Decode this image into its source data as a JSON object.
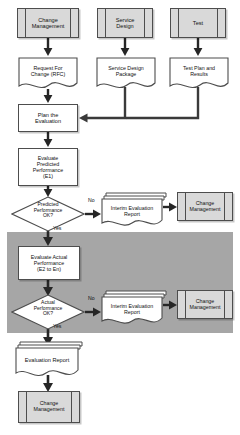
{
  "diagram": {
    "type": "flowchart",
    "colors": {
      "process_fill": "#ffffff",
      "predefined_process_fill": "#d9d9d9",
      "document_fill": "#ffffff",
      "band_fill": "#a6a6a6",
      "stroke": "#4d4d4d",
      "arrow": "#262626",
      "text": "#111111"
    },
    "band": {
      "name": "iterative-actual-evaluation-band",
      "note": "shaded region enclosing the repeated actual-performance evaluation loop"
    },
    "inputs": [
      {
        "id": "change-management-top",
        "shape": "predefined-process",
        "label": "Change\nManagement",
        "label_lines": [
          "Change",
          "Management"
        ],
        "produces": "request-for-change"
      },
      {
        "id": "service-design",
        "shape": "predefined-process",
        "label": "Service\nDesign",
        "label_lines": [
          "Service",
          "Design"
        ],
        "produces": "service-design-package"
      },
      {
        "id": "test",
        "shape": "predefined-process",
        "label": "Test",
        "label_lines": [
          "Test"
        ],
        "produces": "test-plan-and-results"
      }
    ],
    "documents": {
      "rfc": {
        "label_lines": [
          "Request For",
          "Change (RFC)"
        ],
        "label": "Request For Change (RFC)"
      },
      "sdp": {
        "label_lines": [
          "Service Design",
          "Package"
        ],
        "label": "Service Design Package"
      },
      "tpr": {
        "label_lines": [
          "Test Plan and",
          "Results"
        ],
        "label": "Test Plan and Results"
      },
      "interim1": {
        "label_lines": [
          "Interim Evaluation",
          "Report"
        ],
        "label": "Interim Evaluation Report"
      },
      "interim2": {
        "label_lines": [
          "Interim Evaluation",
          "Report"
        ],
        "label": "Interim Evaluation Report"
      },
      "evaluation_report": {
        "label_lines": [
          "Evaluation Report"
        ],
        "label": "Evaluation Report"
      }
    },
    "processes": {
      "plan": {
        "label_lines": [
          "Plan the",
          "Evaluation"
        ],
        "label": "Plan the Evaluation"
      },
      "eval_predicted": {
        "label_lines": [
          "Evaluate",
          "Predicted",
          "Performance",
          "(E1)"
        ],
        "label": "Evaluate Predicted Performance (E1)"
      },
      "eval_actual": {
        "label_lines": [
          "Evaluate Actual",
          "Performance",
          "(E2 to En)"
        ],
        "label": "Evaluate Actual Performance (E2 to En)"
      }
    },
    "decisions": {
      "predicted_ok": {
        "label_lines": [
          "Predicted",
          "Performance",
          "OK?"
        ],
        "label": "Predicted Performance OK?",
        "yes": "Yes",
        "no": "No"
      },
      "actual_ok": {
        "label_lines": [
          "Actual",
          "Performance",
          "OK?"
        ],
        "label": "Actual Performance OK?",
        "yes": "Yes",
        "no": "No"
      }
    },
    "outputs": [
      {
        "id": "change-management-interim-1",
        "shape": "predefined-process",
        "label_lines": [
          "Change",
          "Management"
        ],
        "label": "Change Management"
      },
      {
        "id": "change-management-interim-2",
        "shape": "predefined-process",
        "label_lines": [
          "Change",
          "Management"
        ],
        "label": "Change Management"
      },
      {
        "id": "change-management-final",
        "shape": "predefined-process",
        "label_lines": [
          "Change",
          "Management"
        ],
        "label": "Change Management"
      }
    ]
  }
}
